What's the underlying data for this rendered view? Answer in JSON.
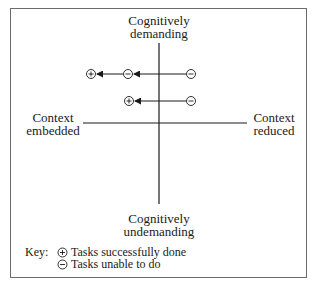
{
  "diagram": {
    "axes": {
      "top_label": [
        "Cognitively",
        "demanding"
      ],
      "bottom_label": [
        "Cognitively",
        "undemanding"
      ],
      "left_label": [
        "Context",
        "embedded"
      ],
      "right_label": [
        "Context",
        "reduced"
      ]
    },
    "arrows": [
      {
        "row": 1,
        "points": [
          {
            "symbol": "minus",
            "x": 191,
            "y": 74
          },
          {
            "symbol": "minus",
            "x": 128,
            "y": 74
          },
          {
            "symbol": "plus",
            "x": 91,
            "y": 74
          }
        ]
      },
      {
        "row": 2,
        "points": [
          {
            "symbol": "minus",
            "x": 191,
            "y": 101
          },
          {
            "symbol": "plus",
            "x": 129,
            "y": 101
          }
        ]
      }
    ],
    "key": {
      "prefix": "Key:",
      "items": [
        {
          "symbol": "plus",
          "label": "Tasks successfully done"
        },
        {
          "symbol": "minus",
          "label": "Tasks unable to do"
        }
      ]
    },
    "colors": {
      "line": "#1a1a1a",
      "frame": "#6b6b6b",
      "background": "#ffffff"
    }
  }
}
